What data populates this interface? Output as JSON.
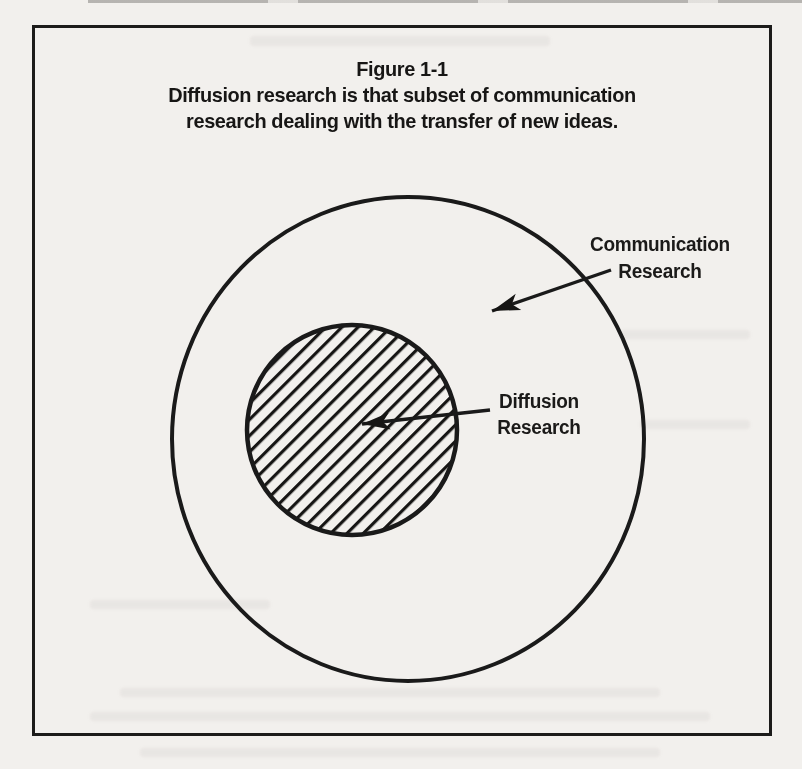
{
  "figure": {
    "number": "Figure 1-1",
    "caption_line1": "Diffusion research is that subset of communication",
    "caption_line2": "research dealing with the transfer of new ideas.",
    "outer_label": {
      "line1": "Communication",
      "line2": "Research"
    },
    "inner_label": {
      "line1": "Diffusion",
      "line2": "Research"
    },
    "colors": {
      "paper": "#f2f0ed",
      "ink": "#1a1a1a"
    }
  },
  "diagram": {
    "type": "venn-subset",
    "outer_set": "Communication Research",
    "inner_set": "Diffusion Research",
    "inner_set_fill": "diagonal-hatch",
    "relationship": "inner set is a subset of outer set"
  }
}
